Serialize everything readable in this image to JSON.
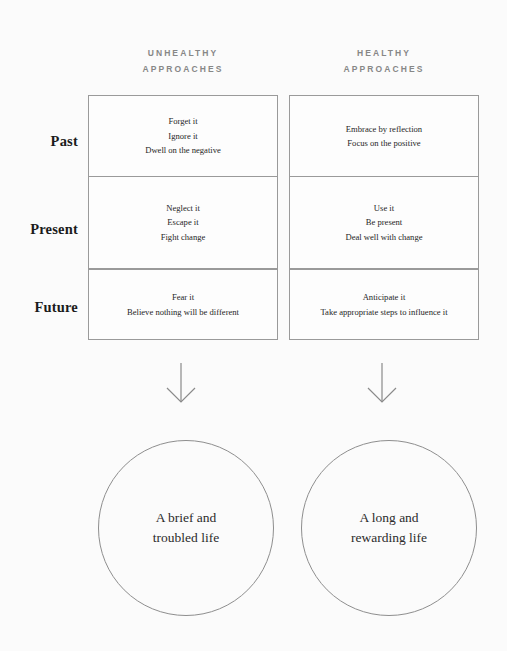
{
  "columns": [
    {
      "id": "unhealthy",
      "line1": "UNHEALTHY",
      "line2": "APPROACHES"
    },
    {
      "id": "healthy",
      "line1": "HEALTHY",
      "line2": "APPROACHES"
    }
  ],
  "rows": [
    {
      "label": "Past",
      "unhealthy": [
        "Forget it",
        "Ignore it",
        "Dwell on the negative"
      ],
      "healthy": [
        "Embrace by reflection",
        "Focus on the positive"
      ]
    },
    {
      "label": "Present",
      "unhealthy": [
        "Neglect it",
        "Escape it",
        "Fight change"
      ],
      "healthy": [
        "Use it",
        "Be present",
        "Deal well with change"
      ]
    },
    {
      "label": "Future",
      "unhealthy": [
        "Fear it",
        "Believe nothing will be different"
      ],
      "healthy": [
        "Anticipate it",
        "Take appropriate steps to influence it"
      ]
    }
  ],
  "arrows": [
    {
      "id": "arrow-unhealthy",
      "direction": "down"
    },
    {
      "id": "arrow-healthy",
      "direction": "down"
    }
  ],
  "outcomes": [
    {
      "id": "outcome-unhealthy",
      "line1": "A brief and",
      "line2": "troubled life"
    },
    {
      "id": "outcome-healthy",
      "line1": "A long and",
      "line2": "rewarding life"
    }
  ],
  "colors": {
    "background": "#fbfbfb",
    "border": "#9a9a9a",
    "circle_border": "#8e8e8e",
    "header_text": "#878787",
    "body_text": "#262626",
    "label_text": "#1b1b1b",
    "arrow": "#8a8a8a"
  }
}
